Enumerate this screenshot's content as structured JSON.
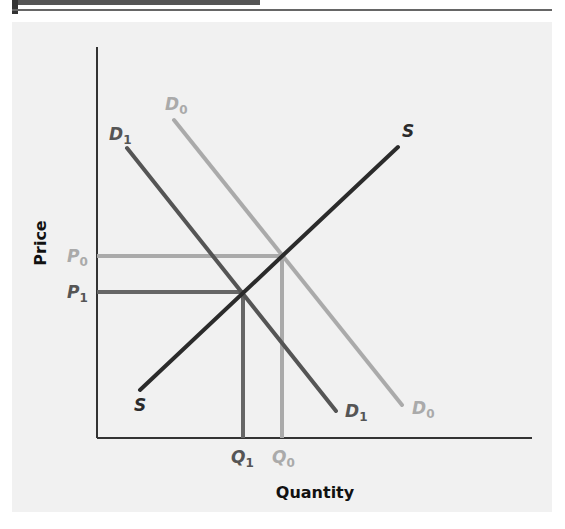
{
  "figure": {
    "x_axis_label": "Quantity",
    "y_axis_label": "Price",
    "labels": {
      "S_top": "S",
      "S_bottom": "S",
      "D0_top": "D",
      "D0_top_sub": "0",
      "D0_bottom": "D",
      "D0_bottom_sub": "0",
      "D1_top": "D",
      "D1_top_sub": "1",
      "D1_bottom": "D",
      "D1_bottom_sub": "1",
      "P0": "P",
      "P0_sub": "0",
      "P1": "P",
      "P1_sub": "1",
      "Q0": "Q",
      "Q0_sub": "0",
      "Q1": "Q",
      "Q1_sub": "1"
    },
    "colors": {
      "supply": "#2b2b2b",
      "demand_D1": "#555555",
      "demand_D0": "#aaaaaa",
      "axis": "#333333",
      "panel": "#f1f1f1"
    }
  }
}
